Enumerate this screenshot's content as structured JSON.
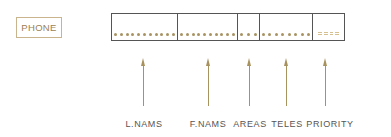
{
  "record_name": "PHONE",
  "colors": {
    "accent": "#a8925e",
    "record_border": "#555555",
    "label_text": "#555555",
    "name_text": "#9c7f52"
  },
  "fields": [
    {
      "name": "L.NAMS",
      "dot_count": 11,
      "fill": "dots"
    },
    {
      "name": "F.NAMS",
      "dot_count": 10,
      "fill": "dots"
    },
    {
      "name": "AREAS",
      "dot_count": 3,
      "fill": "dots"
    },
    {
      "name": "TELES",
      "dot_count": 8,
      "fill": "dots"
    },
    {
      "name": "PRIORITY",
      "dot_count": 4,
      "fill": "dashes"
    }
  ]
}
